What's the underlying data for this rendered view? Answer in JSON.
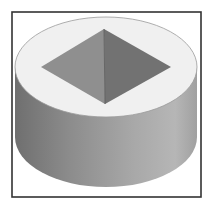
{
  "figure": {
    "frame": {
      "x": 12,
      "y": 12,
      "width": 189,
      "height": 185,
      "stroke": "#333333"
    },
    "cylinder": {
      "top_ellipse": {
        "cx": 106,
        "cy": 67,
        "rx": 91,
        "ry": 50,
        "fill": "#f0f0f0",
        "stroke": "#9a9a9a"
      },
      "bottom_ellipse": {
        "cx": 106,
        "cy": 137,
        "rx": 91,
        "ry": 50
      },
      "side_gradient": [
        "#6f6f6f",
        "#8c8c8c",
        "#a8a8a8",
        "#b6b6b6",
        "#a0a0a0"
      ]
    },
    "recess": {
      "top": [
        104,
        29
      ],
      "left": [
        41,
        67
      ],
      "right": [
        171,
        67
      ],
      "bottom": [
        105,
        104
      ],
      "left_face_fill": "#8f8f8f",
      "right_face_fill": "#727272",
      "edge_stroke": "#555555"
    }
  }
}
